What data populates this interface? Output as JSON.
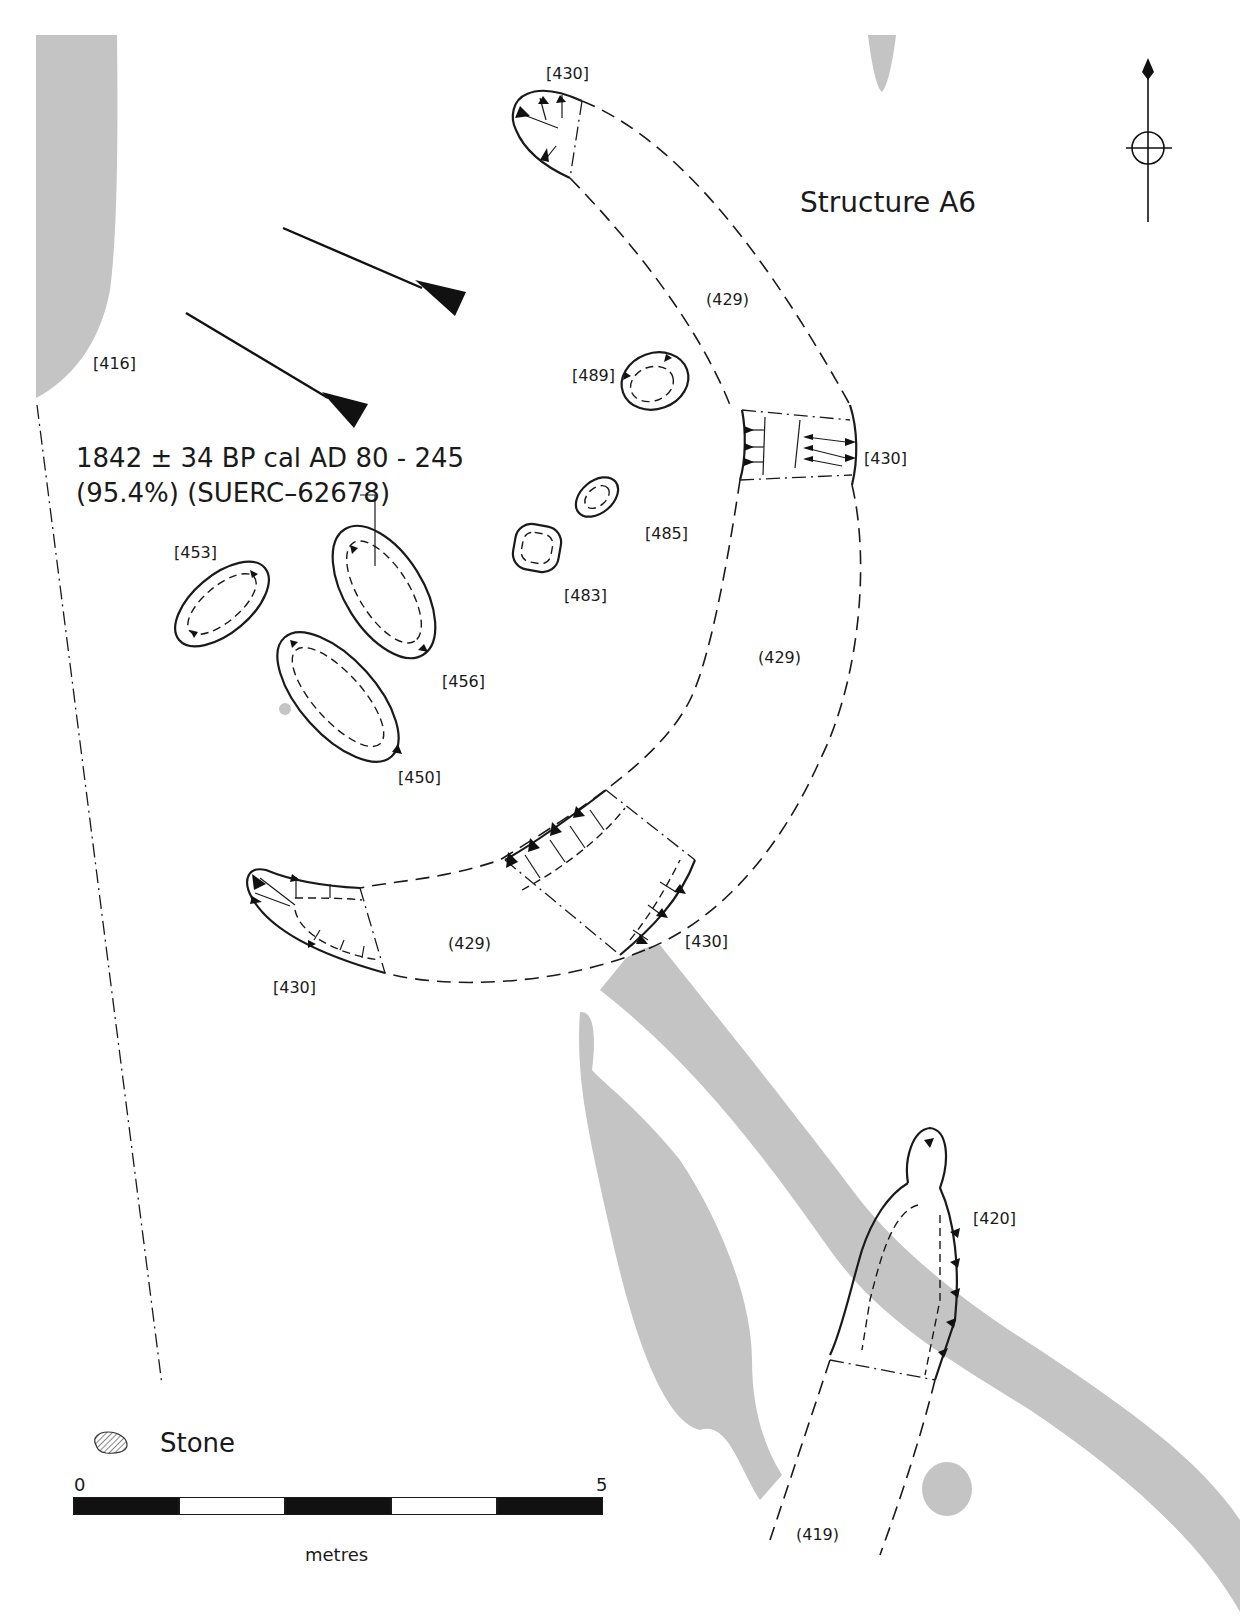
{
  "title": "Structure A6",
  "radiocarbon": {
    "line1": "1842 ± 34 BP cal AD 80 - 245",
    "line2": "(95.4%) (SUERC–62678)"
  },
  "labels": {
    "c416": "[416]",
    "c430_top": "[430]",
    "c430_right": "[430]",
    "c430_bottom_mid": "[430]",
    "c430_bottom_left": "[430]",
    "f429_top": "(429)",
    "f429_mid": "(429)",
    "f429_bottom": "(429)",
    "c489": "[489]",
    "c485": "[485]",
    "c483": "[483]",
    "c453": "[453]",
    "c456": "[456]",
    "c450": "[450]",
    "c420": "[420]",
    "f419": "(419)"
  },
  "legend": {
    "stone_label": "Stone",
    "stone_icon": "hatched-stone-icon"
  },
  "scale": {
    "start": "0",
    "end": "5",
    "unit": "metres",
    "segments": [
      "black",
      "white",
      "black",
      "white",
      "black"
    ]
  },
  "north_arrow": "north-arrow-icon",
  "colors": {
    "ground": "#c4c4c4",
    "ink": "#1a1a1a"
  }
}
